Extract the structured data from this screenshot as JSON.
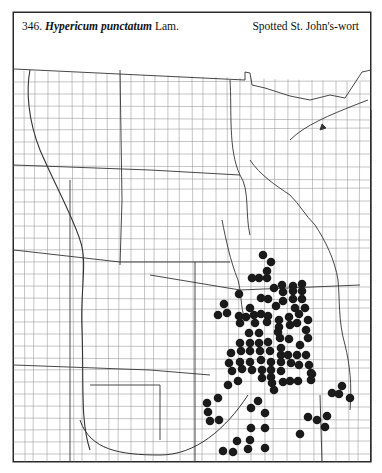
{
  "header": {
    "number": "346.",
    "species": "Hypericum punctatum",
    "authority": "Lam.",
    "common_name": "Spotted St. John's-wort"
  },
  "map": {
    "region": "Great Plains / Upper Midwest county map",
    "marker_color": "#1a1a1a",
    "line_color": "#555555",
    "marker_radius": 4.3,
    "occurrences": [
      [
        263,
        255
      ],
      [
        271,
        262
      ],
      [
        267,
        271
      ],
      [
        267,
        278
      ],
      [
        252,
        278
      ],
      [
        259,
        278
      ],
      [
        274,
        288
      ],
      [
        282,
        285
      ],
      [
        293,
        286
      ],
      [
        302,
        284
      ],
      [
        283,
        292
      ],
      [
        293,
        291
      ],
      [
        302,
        291
      ],
      [
        239,
        294
      ],
      [
        261,
        298
      ],
      [
        268,
        299
      ],
      [
        283,
        301
      ],
      [
        293,
        299
      ],
      [
        302,
        299
      ],
      [
        276,
        306
      ],
      [
        250,
        308
      ],
      [
        295,
        308
      ],
      [
        305,
        308
      ],
      [
        224,
        304
      ],
      [
        218,
        315
      ],
      [
        227,
        313
      ],
      [
        239,
        316
      ],
      [
        246,
        317
      ],
      [
        254,
        315
      ],
      [
        261,
        314
      ],
      [
        268,
        316
      ],
      [
        289,
        317
      ],
      [
        299,
        314
      ],
      [
        240,
        323
      ],
      [
        255,
        323
      ],
      [
        267,
        322
      ],
      [
        279,
        320
      ],
      [
        279,
        327
      ],
      [
        290,
        325
      ],
      [
        297,
        323
      ],
      [
        308,
        320
      ],
      [
        249,
        333
      ],
      [
        259,
        333
      ],
      [
        278,
        332
      ],
      [
        306,
        330
      ],
      [
        240,
        343
      ],
      [
        250,
        343
      ],
      [
        259,
        343
      ],
      [
        268,
        342
      ],
      [
        280,
        338
      ],
      [
        289,
        339
      ],
      [
        300,
        345
      ],
      [
        308,
        338
      ],
      [
        231,
        353
      ],
      [
        241,
        351
      ],
      [
        250,
        351
      ],
      [
        260,
        351
      ],
      [
        270,
        351
      ],
      [
        281,
        348
      ],
      [
        281,
        355
      ],
      [
        288,
        355
      ],
      [
        297,
        355
      ],
      [
        306,
        355
      ],
      [
        229,
        363
      ],
      [
        240,
        362
      ],
      [
        250,
        362
      ],
      [
        261,
        360
      ],
      [
        271,
        362
      ],
      [
        281,
        362
      ],
      [
        291,
        363
      ],
      [
        299,
        365
      ],
      [
        309,
        365
      ],
      [
        232,
        371
      ],
      [
        242,
        369
      ],
      [
        252,
        370
      ],
      [
        262,
        370
      ],
      [
        271,
        370
      ],
      [
        281,
        371
      ],
      [
        311,
        373
      ],
      [
        312,
        374
      ],
      [
        262,
        378
      ],
      [
        271,
        377
      ],
      [
        311,
        380
      ],
      [
        228,
        385
      ],
      [
        238,
        381
      ],
      [
        272,
        383
      ],
      [
        283,
        382
      ],
      [
        290,
        381
      ],
      [
        298,
        381
      ],
      [
        274,
        390
      ],
      [
        342,
        386
      ],
      [
        332,
        393
      ],
      [
        339,
        394
      ],
      [
        350,
        398
      ],
      [
        218,
        398
      ],
      [
        258,
        401
      ],
      [
        207,
        403
      ],
      [
        251,
        408
      ],
      [
        208,
        412
      ],
      [
        265,
        413
      ],
      [
        210,
        421
      ],
      [
        219,
        420
      ],
      [
        251,
        428
      ],
      [
        265,
        428
      ],
      [
        308,
        417
      ],
      [
        317,
        420
      ],
      [
        327,
        416
      ],
      [
        325,
        427
      ],
      [
        300,
        434
      ],
      [
        237,
        441
      ],
      [
        250,
        440
      ],
      [
        223,
        451
      ],
      [
        233,
        452
      ],
      [
        248,
        449
      ],
      [
        265,
        448
      ]
    ]
  }
}
